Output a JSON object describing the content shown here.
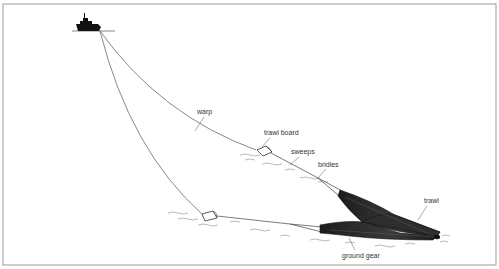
{
  "diagram": {
    "type": "bottom trawl fishing gear illustration",
    "labels": {
      "warp": "warp",
      "trawl_board": "trawl board",
      "sweeps": "sweeps",
      "bridles": "bridles",
      "trawl": "trawl",
      "ground_gear": "ground gear"
    },
    "colors": {
      "line": "#444444",
      "net_fill": "#2a2a2a",
      "frame": "#999999"
    }
  }
}
